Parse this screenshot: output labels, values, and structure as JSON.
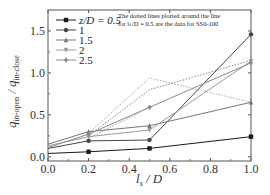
{
  "chart_data": {
    "type": "line",
    "title": "",
    "xlabel": "l_s / D",
    "ylabel": "q_in-open / q_in-close",
    "xlim": [
      0.0,
      1.0
    ],
    "ylim": [
      -0.05,
      1.75
    ],
    "x_ticks": [
      "0.0",
      "0.2",
      "0.4",
      "0.6",
      "0.8",
      "1.0"
    ],
    "y_ticks": [
      "0.0",
      "0.5",
      "1.0",
      "1.5"
    ],
    "grid": false,
    "legend_position": "upper left",
    "legend_title_prefix": "z/D = ",
    "x": [
      0.0,
      0.2,
      0.5,
      1.0
    ],
    "series": [
      {
        "name": "z/D = 0.5",
        "label": "0.5",
        "marker": "square",
        "color": "#1a1a1a",
        "style": "solid",
        "values": [
          0.04,
          0.06,
          0.1,
          0.24
        ]
      },
      {
        "name": "z/D = 1",
        "label": "1",
        "marker": "circle",
        "color": "#444444",
        "style": "solid",
        "values": [
          0.1,
          0.19,
          0.2,
          1.46
        ]
      },
      {
        "name": "z/D = 1.5",
        "label": "1.5",
        "marker": "triangle-up",
        "color": "#777777",
        "style": "solid",
        "values": [
          0.15,
          0.3,
          0.37,
          0.65
        ]
      },
      {
        "name": "z/D = 2",
        "label": "2",
        "marker": "triangle-down",
        "color": "#9a9a9a",
        "style": "solid",
        "values": [
          0.13,
          0.24,
          0.32,
          1.14
        ]
      },
      {
        "name": "z/D = 2.5",
        "label": "2.5",
        "marker": "star",
        "color": "#8a8a8a",
        "style": "solid",
        "values": [
          0.11,
          0.27,
          0.59,
          1.12
        ]
      }
    ],
    "dotted_series": [
      {
        "name": "SS0-100 (a)",
        "color": "#aaaaaa",
        "style": "dotted",
        "x": [
          0.2,
          0.5,
          1.0
        ],
        "values": [
          0.28,
          0.94,
          0.65
        ]
      },
      {
        "name": "SS0-100 (b)",
        "color": "#888888",
        "style": "dotted",
        "x": [
          0.2,
          0.5,
          1.0
        ],
        "values": [
          0.25,
          0.8,
          1.15
        ]
      },
      {
        "name": "SS0-100 (c)",
        "color": "#999999",
        "style": "dotted",
        "x": [
          0.2,
          0.5
        ],
        "values": [
          0.22,
          0.59
        ]
      }
    ],
    "annotations": [
      "The dotted lines plotted around the line",
      "for l_s/D = 0.5 are the data for SS0-100"
    ]
  },
  "labels": {
    "note_line1": "The dotted lines plotted around the line",
    "note_line2": "for lₛ/D = 0.5 are the data for SS0-100",
    "xlabel_main": "l",
    "xlabel_sub": "s",
    "xlabel_rest": " / D",
    "ylabel_q1": "q",
    "ylabel_sub1": "in-open",
    "ylabel_sep": " / ",
    "ylabel_q2": "q",
    "ylabel_sub2": "in-close",
    "legend_prefix": "z/D = "
  }
}
